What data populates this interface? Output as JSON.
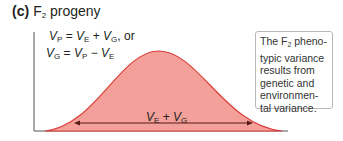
{
  "panel": {
    "label": "(c)",
    "title_prefix": "F",
    "title_sub": "2",
    "title_suffix": " progeny"
  },
  "formulas": {
    "line1": {
      "a": "V",
      "a_sub": "P",
      "eq": " = ",
      "b": "V",
      "b_sub": "E",
      "plus": " + ",
      "c": "V",
      "c_sub": "G",
      "tail": ", or"
    },
    "line2": {
      "a": "V",
      "a_sub": "G",
      "eq": " = ",
      "b": "V",
      "b_sub": "P",
      "minus": " − ",
      "c": "V",
      "c_sub": "E"
    }
  },
  "note": {
    "pre": "The F",
    "sub": "2",
    "post": " pheno-typic variance results from genetic and environmen-tal variance."
  },
  "arrow_label": {
    "a": "V",
    "a_sub": "E",
    "plus": " + ",
    "b": "V",
    "b_sub": "G"
  },
  "colors": {
    "fill": "#f4a09a",
    "stroke": "#d9403a",
    "axis": "#555555",
    "arrow": "#5a1a14"
  }
}
